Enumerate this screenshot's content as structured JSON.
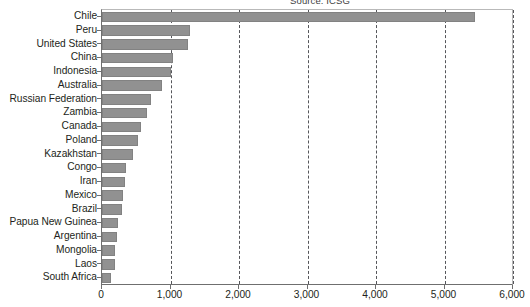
{
  "source_note": "Source: ICSG",
  "colors": {
    "bar": "#919191",
    "bar_border": "#828282",
    "axis": "#6f6f6f",
    "grid": "#55565a",
    "text": "#231f20",
    "frame": "#b9b9b9",
    "background": "#ffffff"
  },
  "chart_data": {
    "type": "bar",
    "orientation": "horizontal",
    "title": "",
    "subtitle": "Source: ICSG",
    "xlabel": "",
    "ylabel": "",
    "xlim": [
      0,
      6000
    ],
    "ylim": null,
    "grid": true,
    "grid_axis": "x",
    "grid_style": "dashed",
    "legend": false,
    "legend_position": "none",
    "xticks": [
      0,
      1000,
      2000,
      3000,
      4000,
      5000,
      6000
    ],
    "xticklabels": [
      "0",
      "1,000",
      "2,000",
      "3,000",
      "4,000",
      "5,000",
      "6,000"
    ],
    "categories": [
      "Chile",
      "Peru",
      "United States",
      "China",
      "Indonesia",
      "Australia",
      "Russian Federation",
      "Zambia",
      "Canada",
      "Poland",
      "Kazakhstan",
      "Congo",
      "Iran",
      "Mexico",
      "Brazil",
      "Papua New Guinea",
      "Argentina",
      "Mongolia",
      "Laos",
      "South Africa"
    ],
    "values": [
      5440,
      1290,
      1250,
      1030,
      1010,
      870,
      710,
      650,
      570,
      520,
      450,
      350,
      330,
      300,
      290,
      230,
      215,
      190,
      185,
      130
    ],
    "series": [
      {
        "name": "Copper mine production",
        "values": [
          5440,
          1290,
          1250,
          1030,
          1010,
          870,
          710,
          650,
          570,
          520,
          450,
          350,
          330,
          300,
          290,
          230,
          215,
          190,
          185,
          130
        ]
      }
    ]
  }
}
